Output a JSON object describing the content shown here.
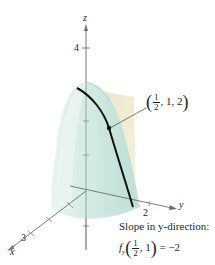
{
  "figure": {
    "type": "3d-surface-partial-derivative",
    "axes": {
      "z": {
        "label": "z",
        "ticks": [
          {
            "value": "4"
          }
        ]
      },
      "x": {
        "label": "x",
        "ticks": [
          {
            "value": "3"
          }
        ]
      },
      "y": {
        "label": "y",
        "ticks": [
          {
            "value": "2"
          }
        ]
      }
    },
    "point_label": {
      "open": "(",
      "frac_num": "1",
      "frac_den": "2",
      "rest": ", 1, 2",
      "close": ")"
    },
    "slope_text": {
      "line1": "Slope in y-direction:",
      "func": "f",
      "sub": "y",
      "open": "(",
      "frac_num": "1",
      "frac_den": "2",
      "rest": ", 1",
      "close": ")",
      "equals": " = −2"
    },
    "colors": {
      "surface": "#cde8e2",
      "surface_edge": "#a9d3cb",
      "plane": "#e8e1c4",
      "curve": "#111111",
      "axis": "#6d6e71",
      "text": "#231f20"
    }
  }
}
